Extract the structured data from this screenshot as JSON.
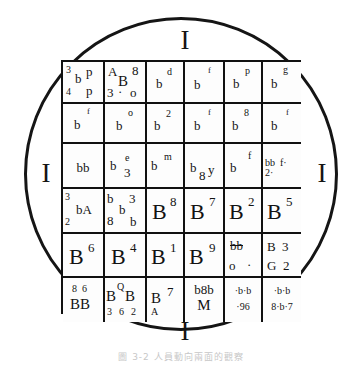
{
  "figure": {
    "shape": "circle",
    "caption": "圖 3-2  人員動向兩面的觀察",
    "markers": {
      "top": "I",
      "left": "I",
      "right": "I",
      "bottom": "I"
    },
    "grid": {
      "rows": 6,
      "cols": 6,
      "cells": [
        [
          {
            "id": "r1c1",
            "glyphs": [
              "3",
              "b",
              "p",
              "4",
              "p"
            ]
          },
          {
            "id": "r1c2",
            "glyphs": [
              "A",
              "8",
              "B",
              "3",
              "·",
              "o"
            ]
          },
          {
            "id": "r1c3",
            "glyphs": [
              "b",
              "d"
            ]
          },
          {
            "id": "r1c4",
            "glyphs": [
              "b",
              "f"
            ]
          },
          {
            "id": "r1c5",
            "glyphs": [
              "b",
              "p"
            ]
          },
          {
            "id": "r1c6",
            "glyphs": [
              "b",
              "g"
            ]
          }
        ],
        [
          {
            "id": "r2c1",
            "glyphs": [
              "b",
              "f"
            ]
          },
          {
            "id": "r2c2",
            "glyphs": [
              "b",
              "o"
            ]
          },
          {
            "id": "r2c3",
            "glyphs": [
              "b",
              "2"
            ]
          },
          {
            "id": "r2c4",
            "glyphs": [
              "b",
              "f"
            ]
          },
          {
            "id": "r2c5",
            "glyphs": [
              "b",
              "8"
            ]
          },
          {
            "id": "r2c6",
            "glyphs": [
              "b",
              "f"
            ]
          }
        ],
        [
          {
            "id": "r3c1",
            "glyphs": [
              "bb"
            ]
          },
          {
            "id": "r3c2",
            "glyphs": [
              "b",
              "e",
              "3"
            ]
          },
          {
            "id": "r3c3",
            "glyphs": [
              "b",
              "m"
            ]
          },
          {
            "id": "r3c4",
            "glyphs": [
              "b",
              "8",
              "y"
            ]
          },
          {
            "id": "r3c5",
            "glyphs": [
              "b",
              "f"
            ]
          },
          {
            "id": "r3c6",
            "glyphs": [
              "bb",
              "f·",
              "2·"
            ]
          }
        ],
        [
          {
            "id": "r4c1",
            "glyphs": [
              "3",
              "bA",
              "2"
            ]
          },
          {
            "id": "r4c2",
            "glyphs": [
              "b",
              "3",
              "b",
              "8",
              "b"
            ]
          },
          {
            "id": "r4c3",
            "glyphs": [
              "B",
              "8"
            ]
          },
          {
            "id": "r4c4",
            "glyphs": [
              "B",
              "7"
            ]
          },
          {
            "id": "r4c5",
            "glyphs": [
              "B",
              "2"
            ]
          },
          {
            "id": "r4c6",
            "glyphs": [
              "B",
              "5"
            ]
          }
        ],
        [
          {
            "id": "r5c1",
            "glyphs": [
              "B",
              "6"
            ]
          },
          {
            "id": "r5c2",
            "glyphs": [
              "B",
              "4"
            ]
          },
          {
            "id": "r5c3",
            "glyphs": [
              "B",
              "1"
            ]
          },
          {
            "id": "r5c4",
            "glyphs": [
              "B",
              "9"
            ]
          },
          {
            "id": "r5c5",
            "glyphs": [
              "bb",
              "o",
              "·"
            ]
          },
          {
            "id": "r5c6",
            "glyphs": [
              "B",
              "3",
              "G",
              "2"
            ]
          }
        ],
        [
          {
            "id": "r6c1",
            "glyphs": [
              "8",
              "6",
              "BB"
            ]
          },
          {
            "id": "r6c2",
            "glyphs": [
              "B",
              "Q",
              "B",
              "3",
              "6",
              "2"
            ]
          },
          {
            "id": "r6c3",
            "glyphs": [
              "B",
              "7",
              "A"
            ]
          },
          {
            "id": "r6c4",
            "glyphs": [
              "b8b",
              "M"
            ]
          },
          {
            "id": "r6c5",
            "glyphs": [
              "·b·b",
              "·96"
            ]
          },
          {
            "id": "r6c6",
            "glyphs": [
              "·b·b",
              "8·b·7"
            ]
          }
        ]
      ]
    }
  },
  "cell_text": {
    "r1c1_a": "3",
    "r1c1_b": "b",
    "r1c1_c": "p",
    "r1c1_d": "4",
    "r1c1_e": "p",
    "r1c2_a": "A",
    "r1c2_b": "8",
    "r1c2_c": "B",
    "r1c2_d": "3",
    "r1c2_e": "·",
    "r1c2_f": "o",
    "r1c3_a": "b",
    "r1c3_b": "d",
    "r1c4_a": "b",
    "r1c4_b": "f",
    "r1c5_a": "b",
    "r1c5_b": "p",
    "r1c6_a": "b",
    "r1c6_b": "g",
    "r2c1_a": "b",
    "r2c1_b": "f",
    "r2c2_a": "b",
    "r2c2_b": "o",
    "r2c3_a": "b",
    "r2c3_b": "2",
    "r2c4_a": "b",
    "r2c4_b": "f",
    "r2c5_a": "b",
    "r2c5_b": "8",
    "r2c6_a": "b",
    "r2c6_b": "f",
    "r3c1_a": "bb",
    "r3c2_a": "b",
    "r3c2_b": "e",
    "r3c2_c": "3",
    "r3c3_a": "b",
    "r3c3_b": "m",
    "r3c4_a": "b",
    "r3c4_b": "8",
    "r3c4_c": "y",
    "r3c5_a": "b",
    "r3c5_b": "f",
    "r3c6_a": "bb",
    "r3c6_b": "f·",
    "r3c6_c": "2·",
    "r4c1_a": "3",
    "r4c1_b": "bA",
    "r4c1_c": "2",
    "r4c2_a": "b",
    "r4c2_b": "3",
    "r4c2_c": "b",
    "r4c2_d": "8",
    "r4c2_e": "b",
    "r4c3_a": "B",
    "r4c3_b": "8",
    "r4c4_a": "B",
    "r4c4_b": "7",
    "r4c5_a": "B",
    "r4c5_b": "2",
    "r4c6_a": "B",
    "r4c6_b": "5",
    "r5c1_a": "B",
    "r5c1_b": "6",
    "r5c2_a": "B",
    "r5c2_b": "4",
    "r5c3_a": "B",
    "r5c3_b": "1",
    "r5c4_a": "B",
    "r5c4_b": "9",
    "r5c5_a": "bb",
    "r5c5_b": "o",
    "r5c5_c": "·",
    "r5c6_a": "B",
    "r5c6_b": "3",
    "r5c6_c": "G",
    "r5c6_d": "2",
    "r6c1_a": "8",
    "r6c1_b": "6",
    "r6c1_c": "BB",
    "r6c2_a": "B",
    "r6c2_b": "Q",
    "r6c2_c": "B",
    "r6c2_d": "3",
    "r6c2_e": "6",
    "r6c2_f": "2",
    "r6c3_a": "B",
    "r6c3_b": "7",
    "r6c3_c": "A",
    "r6c4_a": "b8b",
    "r6c4_b": "M",
    "r6c5_a": "·b·b",
    "r6c5_b": "·96",
    "r6c6_a": "·b·b",
    "r6c6_b": "8·b·7"
  }
}
